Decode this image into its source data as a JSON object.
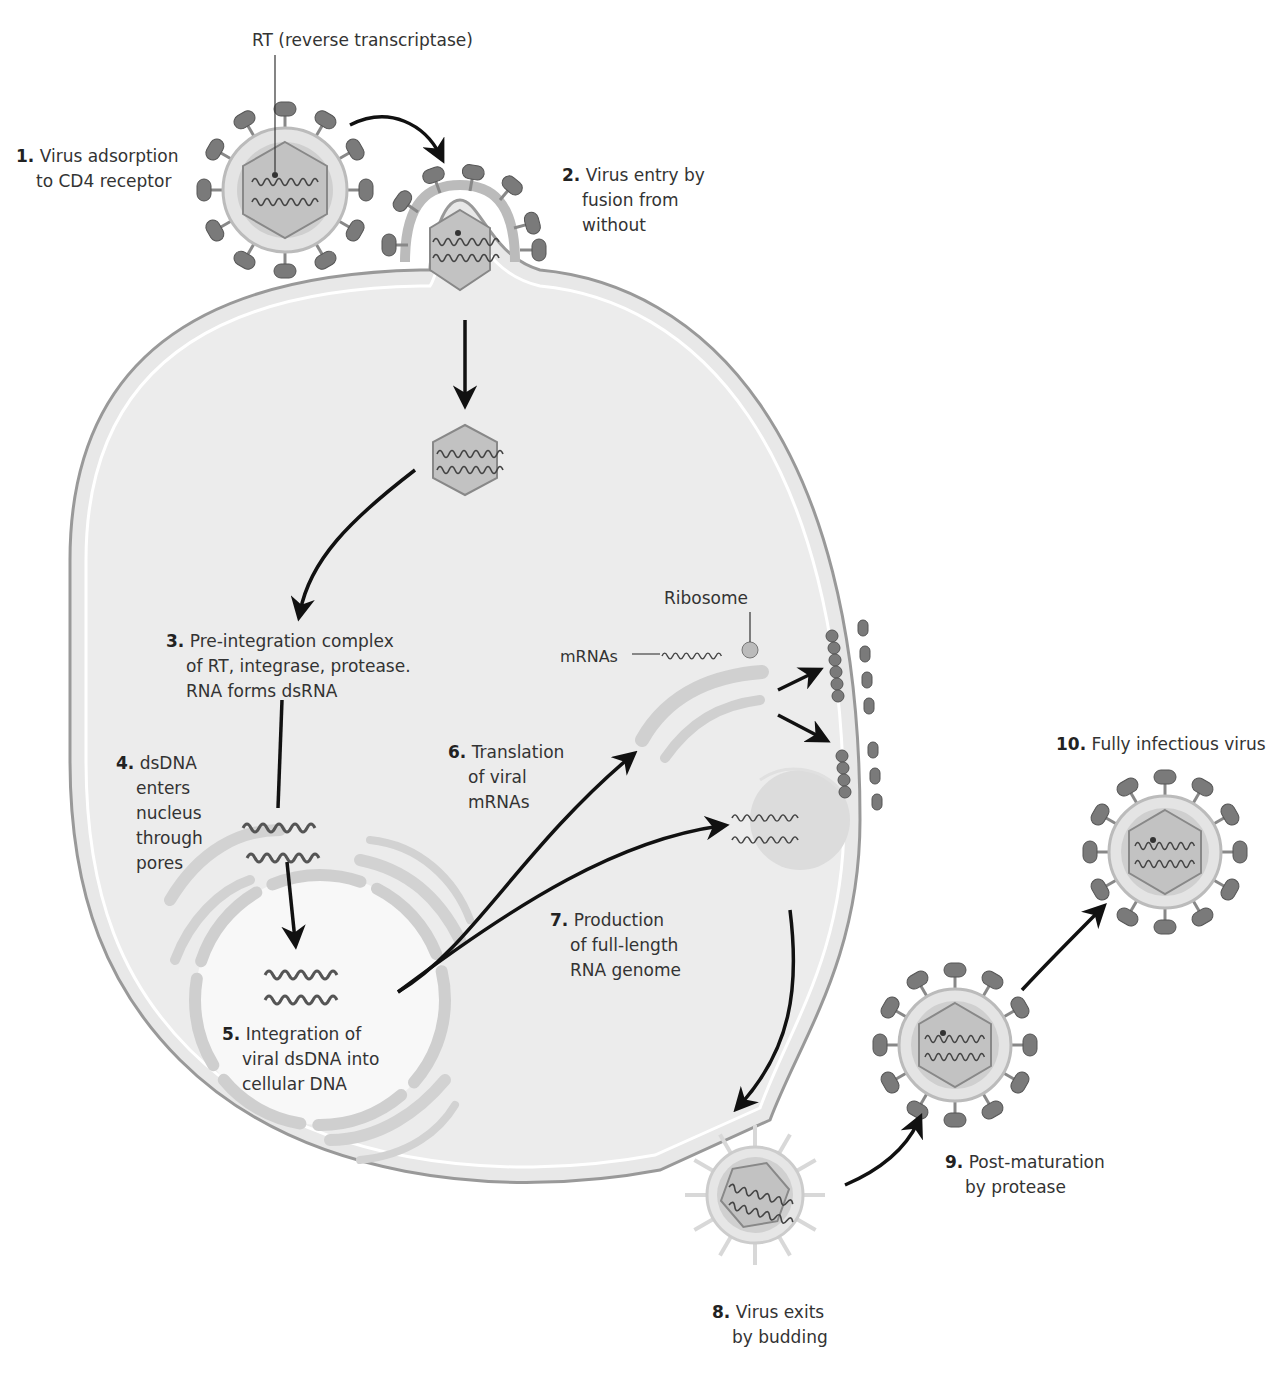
{
  "colors": {
    "cell_fill": "#e6e6e6",
    "membrane": "#c9c9c9",
    "membrane_edge": "#9a9a9a",
    "spike": "#7a7a7a",
    "capsid": "#bdbdbd",
    "nucleus_fill": "#f7f7f7",
    "organelle": "#cfcfcf",
    "arrow": "#111111"
  },
  "callouts": {
    "rt": "RT (reverse transcriptase)",
    "ribosome": "Ribosome",
    "mrnas": "mRNAs"
  },
  "steps": [
    {
      "num": "1.",
      "lines": [
        "Virus adsorption",
        "to CD4 receptor"
      ]
    },
    {
      "num": "2.",
      "lines": [
        "Virus entry by",
        "fusion from",
        "without"
      ]
    },
    {
      "num": "3.",
      "lines": [
        "Pre-integration complex",
        "of RT, integrase, protease.",
        "RNA forms dsRNA"
      ]
    },
    {
      "num": "4.",
      "lines": [
        "dsDNA",
        "enters",
        "nucleus",
        "through",
        "pores"
      ]
    },
    {
      "num": "5.",
      "lines": [
        "Integration of",
        "viral dsDNA into",
        "cellular DNA"
      ]
    },
    {
      "num": "6.",
      "lines": [
        "Translation",
        "of viral",
        "mRNAs"
      ]
    },
    {
      "num": "7.",
      "lines": [
        "Production",
        "of full-length",
        "RNA genome"
      ]
    },
    {
      "num": "8.",
      "lines": [
        "Virus exits",
        "by budding"
      ]
    },
    {
      "num": "9.",
      "lines": [
        "Post-maturation",
        "by protease"
      ]
    },
    {
      "num": "10.",
      "lines": [
        "Fully infectious virus"
      ]
    }
  ]
}
